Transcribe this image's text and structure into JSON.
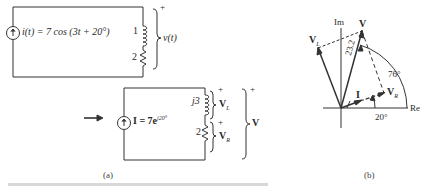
{
  "panel_a": {
    "caption": "(a)",
    "top_circuit": {
      "source_label": "i(t) = 7 cos (3t + 20°)",
      "inductor_value": "1",
      "resistor_value": "2",
      "voltage_label": "v(t)",
      "plus_sign": "+"
    },
    "arrow": "→",
    "bottom_circuit": {
      "source_label": "I = 7e",
      "source_exponent": "j20°",
      "inductor_value": "j3",
      "resistor_value": "2",
      "vl_label": "V",
      "vl_sub": "L",
      "vr_label": "V",
      "vr_sub": "R",
      "v_label": "V",
      "plus_sign": "+",
      "vl_plus": "+",
      "vr_plus": "+"
    }
  },
  "panel_b": {
    "caption": "(b)",
    "axes": {
      "real": "Re",
      "imag": "Im"
    },
    "phasors": {
      "V": "V",
      "VL": "V",
      "VL_sub": "L",
      "VR": "V",
      "VR_sub": "R",
      "I": "I"
    },
    "magnitude_label": "23.2",
    "angle_v": "76°",
    "angle_i": "20°"
  }
}
